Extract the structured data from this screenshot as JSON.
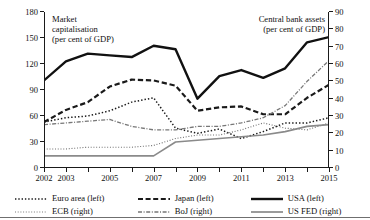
{
  "chart_data": {
    "type": "line",
    "title": "",
    "title_left": "Market\ncapitalisation\n(per cent of GDP)",
    "title_right": "Central bank assets\n(per cent of GDP)",
    "xlabel": "",
    "ylabel_left": "Market capitalisation (per cent of GDP)",
    "ylabel_right": "Central bank assets (per cent of GDP)",
    "x": [
      2002,
      2003,
      2004,
      2005,
      2006,
      2007,
      2008,
      2009,
      2010,
      2011,
      2012,
      2013,
      2014,
      2015
    ],
    "xlim": [
      2002,
      2015
    ],
    "xticks": [
      2002,
      2003,
      2004,
      2005,
      2006,
      2007,
      2008,
      2009,
      2010,
      2011,
      2012,
      2013,
      2014,
      2015
    ],
    "xticklabels": [
      "2002",
      "2003",
      "",
      "2005",
      "",
      "2007",
      "",
      "2009",
      "",
      "2011",
      "",
      "2013",
      "",
      "2015"
    ],
    "ylim_left": [
      0,
      180
    ],
    "yticks_left": [
      0,
      30,
      60,
      90,
      120,
      150,
      180
    ],
    "ylim_right": [
      0,
      90
    ],
    "yticks_right": [
      0,
      10,
      20,
      30,
      40,
      50,
      60,
      70,
      80,
      90
    ],
    "grid": false,
    "legend_position": "bottom",
    "series": [
      {
        "name": "Euro area (left)",
        "axis": "left",
        "style": "dotted",
        "color": "#1a1a1a",
        "width": 1.5,
        "values": [
          53,
          58,
          60,
          66,
          76,
          81,
          46,
          40,
          45,
          34,
          42,
          52,
          52,
          58
        ]
      },
      {
        "name": "ECB (right)",
        "axis": "right",
        "style": "fine-dotted",
        "color": "#6e6e6e",
        "width": 1.1,
        "values": [
          11,
          11,
          12,
          12,
          12,
          13,
          17,
          19,
          19,
          22,
          26,
          23,
          22,
          26
        ]
      },
      {
        "name": "Japan (left)",
        "axis": "left",
        "style": "dashed",
        "color": "#1a1a1a",
        "width": 2.2,
        "values": [
          53,
          67,
          76,
          94,
          102,
          101,
          95,
          66,
          70,
          71,
          62,
          62,
          81,
          96
        ]
      },
      {
        "name": "BoJ (right)",
        "axis": "right",
        "style": "dash-dot",
        "color": "#777777",
        "width": 1.3,
        "values": [
          25,
          26,
          27,
          28,
          24,
          22,
          22,
          24,
          24,
          26,
          29,
          36,
          50,
          62
        ]
      },
      {
        "name": "USA (left)",
        "axis": "left",
        "style": "solid",
        "color": "#111111",
        "width": 2.4,
        "values": [
          101,
          123,
          132,
          130,
          128,
          141,
          137,
          80,
          106,
          113,
          104,
          115,
          145,
          151
        ]
      },
      {
        "name": "US FED (right)",
        "axis": "right",
        "style": "solid",
        "color": "#8a8a8a",
        "width": 1.6,
        "values": [
          7,
          7,
          7,
          7,
          7,
          7,
          15,
          16,
          17,
          18,
          19,
          21,
          24,
          25
        ]
      }
    ]
  },
  "legend": {
    "entries": [
      {
        "label": "Euro area (left)",
        "swatch": "dotted-line-icon"
      },
      {
        "label": "Japan (left)",
        "swatch": "dashed-line-icon"
      },
      {
        "label": "USA (left)",
        "swatch": "solid-thick-line-icon"
      },
      {
        "label": "ECB (right)",
        "swatch": "fine-dotted-line-icon"
      },
      {
        "label": "BoJ (right)",
        "swatch": "dash-dot-line-icon"
      },
      {
        "label": "US FED (right)",
        "swatch": "solid-gray-line-icon"
      }
    ]
  },
  "colors": {
    "axis": "#1a1a1a",
    "left_series": "#111111",
    "right_series": "#8a8a8a",
    "background": "#ffffff"
  }
}
